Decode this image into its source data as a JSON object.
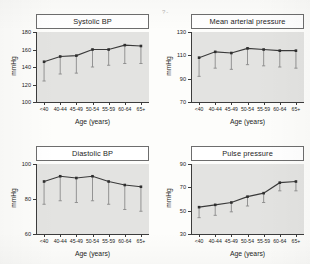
{
  "axis": {
    "ylabel": "mmHg",
    "xlabel": "Age (years)",
    "categories": [
      "<40",
      "40-44",
      "45-49",
      "50-54",
      "55-59",
      "60-64",
      "65+"
    ]
  },
  "artifact": {
    "mark": "?-"
  },
  "panels": [
    {
      "key": "systolic",
      "title": "Systolic BP",
      "ylabel": "mmHg",
      "xlabel": "Age (years)",
      "yticks": [
        100,
        120,
        140,
        160,
        180
      ]
    },
    {
      "key": "map",
      "title": "Mean arterial pressure",
      "ylabel": "mmHg",
      "xlabel": "Age (years)",
      "yticks": [
        70,
        90,
        110,
        130
      ]
    },
    {
      "key": "diastolic",
      "title": "Diastolic BP",
      "ylabel": "mmHg",
      "xlabel": "Age (years)",
      "yticks": [
        60,
        80,
        100
      ]
    },
    {
      "key": "pulse",
      "title": "Pulse pressure",
      "ylabel": "mmHg",
      "xlabel": "Age (years)",
      "yticks": [
        30,
        50,
        70,
        90
      ]
    }
  ],
  "chart_data": [
    {
      "type": "line",
      "title": "Systolic BP",
      "xlabel": "Age (years)",
      "ylabel": "mmHg",
      "ylim": [
        100,
        180
      ],
      "yticks": [
        100,
        120,
        140,
        160,
        180
      ],
      "grid": false,
      "legend": "none",
      "categories": [
        "<40",
        "40-44",
        "45-49",
        "50-54",
        "55-59",
        "60-64",
        "65+"
      ],
      "values": [
        146,
        152,
        153,
        160,
        160,
        165,
        164
      ],
      "error_low": [
        124,
        132,
        133,
        140,
        142,
        144,
        144
      ],
      "error_type": "lower-whisker"
    },
    {
      "type": "line",
      "title": "Mean arterial pressure",
      "xlabel": "Age (years)",
      "ylabel": "mmHg",
      "ylim": [
        70,
        130
      ],
      "yticks": [
        70,
        90,
        110,
        130
      ],
      "grid": false,
      "legend": "none",
      "categories": [
        "<40",
        "40-44",
        "45-49",
        "50-54",
        "55-59",
        "60-64",
        "65+"
      ],
      "values": [
        108,
        113,
        112,
        116,
        115,
        114,
        114
      ],
      "error_low": [
        92,
        99,
        98,
        102,
        101,
        100,
        99
      ],
      "error_type": "lower-whisker"
    },
    {
      "type": "line",
      "title": "Diastolic BP",
      "xlabel": "Age (years)",
      "ylabel": "mmHg",
      "ylim": [
        60,
        100
      ],
      "yticks": [
        60,
        80,
        100
      ],
      "grid": false,
      "legend": "none",
      "categories": [
        "<40",
        "40-44",
        "45-49",
        "50-54",
        "55-59",
        "60-64",
        "65+"
      ],
      "values": [
        90,
        93,
        92,
        93,
        90,
        88,
        87
      ],
      "error_low": [
        77,
        79,
        78,
        79,
        77,
        74,
        73
      ],
      "error_type": "lower-whisker"
    },
    {
      "type": "line",
      "title": "Pulse pressure",
      "xlabel": "Age (years)",
      "ylabel": "mmHg",
      "ylim": [
        30,
        90
      ],
      "yticks": [
        30,
        50,
        70,
        90
      ],
      "grid": false,
      "legend": "none",
      "categories": [
        "<40",
        "40-44",
        "45-49",
        "50-54",
        "55-59",
        "60-64",
        "65+"
      ],
      "values": [
        53,
        55,
        57,
        62,
        65,
        74,
        75
      ],
      "error_low": [
        44,
        46,
        49,
        54,
        57,
        67,
        67
      ],
      "error_type": "lower-whisker"
    }
  ]
}
